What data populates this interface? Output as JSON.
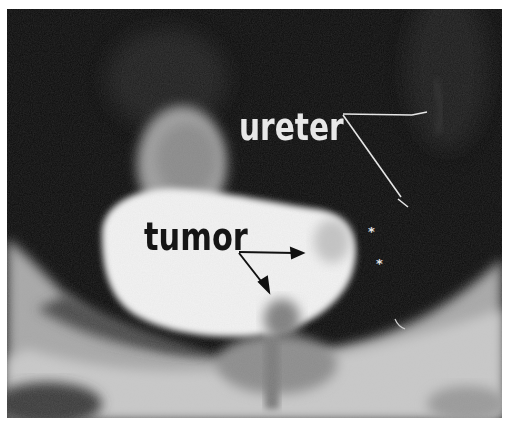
{
  "image": {
    "type": "radiograph",
    "tone": "grayscale"
  },
  "annotations": {
    "ureter_label": "ureter",
    "tumor_label": "tumor",
    "markers": [
      "*",
      "*"
    ]
  },
  "colors": {
    "background": "#0c0c0c",
    "bright_region": "#f4f4f4",
    "soft_tissue": "#b9b9b9",
    "ureter_text": "#e8e8e8",
    "tumor_text": "#151515",
    "page": "#ffffff"
  }
}
